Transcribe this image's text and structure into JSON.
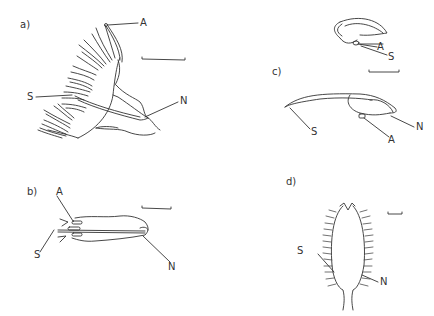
{
  "figure": {
    "panels": [
      {
        "id": "a",
        "label": "a)",
        "annotations": {
          "A": "A",
          "S": "S",
          "N": "N"
        },
        "has_scale_bar": true
      },
      {
        "id": "b",
        "label": "b)",
        "annotations": {
          "A": "A",
          "S": "S",
          "N": "N"
        },
        "has_scale_bar": true
      },
      {
        "id": "c",
        "label": "c)",
        "annotations": {
          "A_top": "A",
          "S_top": "S",
          "S": "S",
          "A": "A",
          "N": "N"
        },
        "has_scale_bar": true
      },
      {
        "id": "d",
        "label": "d)",
        "annotations": {
          "S": "S",
          "N": "N"
        },
        "has_scale_bar": true
      }
    ],
    "colors": {
      "line": "#333333",
      "background": "#ffffff"
    }
  }
}
